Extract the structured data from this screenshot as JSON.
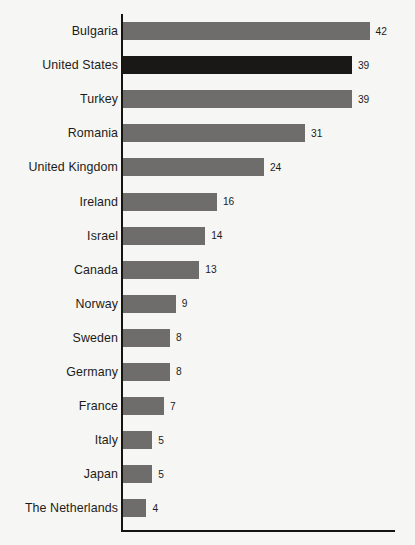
{
  "chart_data": {
    "type": "bar",
    "orientation": "horizontal",
    "title": "",
    "xlabel": "",
    "ylabel": "",
    "grid": false,
    "legend": null,
    "xlim": [
      0,
      46
    ],
    "categories": [
      "Bulgaria",
      "United States",
      "Turkey",
      "Romania",
      "United Kingdom",
      "Ireland",
      "Israel",
      "Canada",
      "Norway",
      "Sweden",
      "Germany",
      "France",
      "Italy",
      "Japan",
      "The Netherlands"
    ],
    "values": [
      42,
      39,
      39,
      31,
      24,
      16,
      14,
      13,
      9,
      8,
      8,
      7,
      5,
      5,
      4
    ],
    "value_labels": [
      "42",
      "39",
      "39",
      "31",
      "24",
      "16",
      "14",
      "13",
      "9",
      "8",
      "8",
      "7",
      "5",
      "5",
      "4"
    ],
    "highlighted_category": "United States",
    "bars": [
      {
        "label": "Bulgaria",
        "value": 42,
        "value_label": "42",
        "highlighted": false
      },
      {
        "label": "United States",
        "value": 39,
        "value_label": "39",
        "highlighted": true
      },
      {
        "label": "Turkey",
        "value": 39,
        "value_label": "39",
        "highlighted": false
      },
      {
        "label": "Romania",
        "value": 31,
        "value_label": "31",
        "highlighted": false
      },
      {
        "label": "United Kingdom",
        "value": 24,
        "value_label": "24",
        "highlighted": false
      },
      {
        "label": "Ireland",
        "value": 16,
        "value_label": "16",
        "highlighted": false
      },
      {
        "label": "Israel",
        "value": 14,
        "value_label": "14",
        "highlighted": false
      },
      {
        "label": "Canada",
        "value": 13,
        "value_label": "13",
        "highlighted": false
      },
      {
        "label": "Norway",
        "value": 9,
        "value_label": "9",
        "highlighted": false
      },
      {
        "label": "Sweden",
        "value": 8,
        "value_label": "8",
        "highlighted": false
      },
      {
        "label": "Germany",
        "value": 8,
        "value_label": "8",
        "highlighted": false
      },
      {
        "label": "France",
        "value": 7,
        "value_label": "7",
        "highlighted": false
      },
      {
        "label": "Italy",
        "value": 5,
        "value_label": "5",
        "highlighted": false
      },
      {
        "label": "Japan",
        "value": 5,
        "value_label": "5",
        "highlighted": false
      },
      {
        "label": "The Netherlands",
        "value": 4,
        "value_label": "4",
        "highlighted": false
      }
    ]
  },
  "style": {
    "background_color": "#f6f6f4",
    "bar_color": "#6e6d6b",
    "highlight_bar_color": "#191816",
    "axis_color": "#15140f",
    "label_color": "#1d1c19",
    "pixels_per_unit": 5.87
  }
}
